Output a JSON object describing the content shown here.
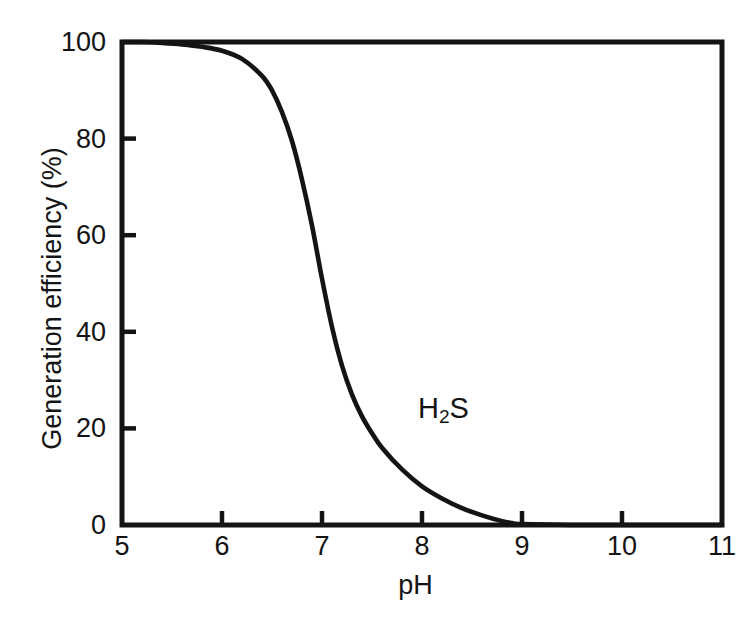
{
  "figure": {
    "background_color": "#ffffff",
    "ink_color": "#141414"
  },
  "annotation_text": "H",
  "annotation_sub": "2",
  "annotation_tail": "S",
  "chart_data": {
    "type": "line",
    "title": "",
    "subtitle": "",
    "xlabel": "pH",
    "ylabel": "Generation efficiency (%)",
    "xlim": [
      5,
      11
    ],
    "ylim": [
      0,
      100
    ],
    "xticks": [
      5,
      6,
      7,
      8,
      9,
      10,
      11
    ],
    "xticklabels": [
      "5",
      "6",
      "7",
      "8",
      "9",
      "10",
      "11"
    ],
    "yticks": [
      0,
      20,
      40,
      60,
      80,
      100
    ],
    "yticklabels": [
      "0",
      "20",
      "40",
      "60",
      "80",
      "100"
    ],
    "grid": false,
    "legend": false,
    "legend_position": "none",
    "tick_direction": "in",
    "frame": "box",
    "line_color": "#141414",
    "line_width": 4,
    "annotations": [
      {
        "text": "H2S",
        "x": 8.2,
        "y": 25
      }
    ],
    "series": [
      {
        "name": "H2S",
        "x": [
          5.0,
          5.2,
          5.4,
          5.6,
          5.8,
          6.0,
          6.2,
          6.4,
          6.5,
          6.6,
          6.7,
          6.8,
          6.9,
          7.0,
          7.1,
          7.2,
          7.3,
          7.4,
          7.5,
          7.6,
          7.8,
          8.0,
          8.2,
          8.4,
          8.6,
          8.8,
          8.9,
          9.0,
          9.5,
          10.0,
          10.5,
          11.0
        ],
        "y": [
          100.0,
          100.0,
          99.8,
          99.5,
          99.0,
          98.2,
          96.5,
          93.0,
          90.0,
          85.5,
          79.5,
          71.5,
          62.0,
          51.0,
          41.0,
          33.0,
          27.0,
          22.5,
          19.0,
          16.0,
          11.5,
          8.0,
          5.5,
          3.5,
          2.0,
          0.8,
          0.4,
          0.2,
          0.0,
          0.0,
          0.0,
          0.0
        ]
      }
    ]
  }
}
